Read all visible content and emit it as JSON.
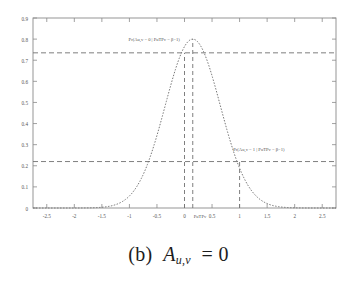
{
  "figure": {
    "caption_prefix": "(b)",
    "caption_var": "A",
    "caption_sub": "u,v",
    "caption_rel": "= 0",
    "caption_full": "(b) Au,v = 0"
  },
  "annotations": {
    "upper": {
      "text": "Pr(Au,v = 0 | PuTPv = β−1)",
      "x_value": -0.55,
      "y_value": 0.79
    },
    "lower": {
      "text": "Pr(Au,v = 1 | PuTPv = β−1)",
      "x_value": 1.35,
      "y_value": 0.27
    },
    "axis_marker": {
      "text": "PuTPv",
      "x_value": 0.15,
      "y_value": 0.0
    }
  },
  "chart_data": {
    "type": "line",
    "title": "",
    "xlabel": "",
    "ylabel": "",
    "xlim": [
      -2.75,
      2.75
    ],
    "ylim": [
      0,
      0.9
    ],
    "xticks": [
      -2.5,
      -2,
      -1.5,
      -1,
      -0.5,
      0,
      0.5,
      1,
      1.5,
      2,
      2.5
    ],
    "xticklabels": [
      "-2.5",
      "-2",
      "-1.5",
      "-1",
      "-0.5",
      "0",
      "0.5",
      "1",
      "1.5",
      "2",
      "2.5"
    ],
    "yticks": [
      0,
      0.1,
      0.2,
      0.3,
      0.4,
      0.5,
      0.6,
      0.7,
      0.8,
      0.9
    ],
    "yticklabels": [
      "0",
      "0.1",
      "0.2",
      "0.3",
      "0.4",
      "0.5",
      "0.6",
      "0.7",
      "0.8",
      "0.9"
    ],
    "grid": false,
    "legend": "none",
    "curve": {
      "name": "gaussian-density",
      "mu": 0.15,
      "sigma": 0.5,
      "peak": 0.8,
      "linestyle": "dotted",
      "color": "#777777"
    },
    "guides": {
      "hlines": [
        {
          "y": 0.735,
          "label": "upper-probability-level"
        },
        {
          "y": 0.22,
          "label": "lower-probability-level"
        }
      ],
      "vlines": [
        {
          "x": 0.0,
          "y_top": 0.735,
          "label": "x-zero-line"
        },
        {
          "x": 0.15,
          "y_top": 0.8,
          "label": "peak-line"
        },
        {
          "x": 1.0,
          "y_top": 0.22,
          "label": "x-one-line"
        }
      ]
    },
    "series": [
      {
        "name": "gaussian-density",
        "x": [
          -2.75,
          -2.6,
          -2.45,
          -2.3,
          -2.15,
          -2.0,
          -1.85,
          -1.7,
          -1.55,
          -1.4,
          -1.25,
          -1.1,
          -0.95,
          -0.8,
          -0.65,
          -0.5,
          -0.35,
          -0.2,
          -0.05,
          0.1,
          0.15,
          0.25,
          0.4,
          0.55,
          0.7,
          0.85,
          1.0,
          1.15,
          1.3,
          1.45,
          1.6,
          1.75,
          1.9,
          2.05,
          2.2,
          2.35,
          2.5,
          2.65,
          2.75
        ],
        "y": [
          0.0,
          0.0,
          0.0,
          0.001,
          0.002,
          0.005,
          0.011,
          0.022,
          0.041,
          0.071,
          0.115,
          0.174,
          0.248,
          0.332,
          0.422,
          0.512,
          0.595,
          0.665,
          0.716,
          0.749,
          0.8,
          0.775,
          0.716,
          0.665,
          0.595,
          0.512,
          0.422,
          0.332,
          0.248,
          0.174,
          0.115,
          0.071,
          0.041,
          0.022,
          0.011,
          0.005,
          0.002,
          0.001,
          0.0
        ]
      }
    ]
  }
}
